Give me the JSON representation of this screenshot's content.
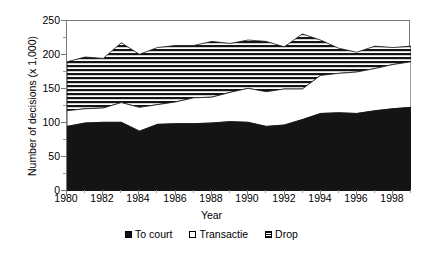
{
  "chart_data": {
    "type": "area",
    "stacked": true,
    "title": "",
    "xlabel": "Year",
    "ylabel": "Number of decisions (x 1,000)",
    "xlim": [
      1980,
      1999
    ],
    "ylim": [
      0,
      250
    ],
    "ytick_values": [
      0,
      50,
      100,
      150,
      200,
      250
    ],
    "ytick_labels": [
      "0",
      "50",
      "100",
      "150",
      "200",
      "250"
    ],
    "xtick_values": [
      1980,
      1982,
      1984,
      1986,
      1988,
      1990,
      1992,
      1994,
      1996,
      1998
    ],
    "xtick_labels": [
      "1980",
      "1982",
      "1984",
      "1986",
      "1988",
      "1990",
      "1992",
      "1994",
      "1996",
      "1998"
    ],
    "x": [
      1980,
      1981,
      1982,
      1983,
      1984,
      1985,
      1986,
      1987,
      1988,
      1989,
      1990,
      1991,
      1992,
      1993,
      1994,
      1995,
      1996,
      1997,
      1998,
      1999
    ],
    "grid": false,
    "legend_position": "bottom",
    "series": [
      {
        "name": "To court",
        "fill": "solid-black",
        "color": "#111111",
        "values": [
          95,
          100,
          101,
          101,
          88,
          98,
          99,
          99,
          100,
          102,
          101,
          95,
          97,
          105,
          114,
          115,
          114,
          118,
          121,
          123
        ]
      },
      {
        "name": "Transactie",
        "fill": "white",
        "color": "#ffffff",
        "values": [
          23,
          21,
          21,
          29,
          35,
          29,
          32,
          38,
          38,
          43,
          50,
          51,
          53,
          45,
          56,
          58,
          61,
          62,
          65,
          67
        ]
      },
      {
        "name": "Drop",
        "fill": "horizontal-stripes",
        "color": "#111111",
        "values": [
          72,
          76,
          73,
          88,
          78,
          84,
          83,
          77,
          82,
          72,
          71,
          74,
          62,
          81,
          52,
          37,
          29,
          33,
          25,
          23
        ]
      }
    ],
    "cumulative_tops": {
      "to_court": [
        95,
        100,
        101,
        101,
        88,
        98,
        99,
        99,
        100,
        102,
        101,
        95,
        97,
        105,
        114,
        115,
        114,
        118,
        121,
        123
      ],
      "transactie": [
        118,
        121,
        122,
        130,
        123,
        127,
        131,
        137,
        138,
        145,
        151,
        146,
        150,
        150,
        170,
        173,
        175,
        180,
        186,
        190
      ],
      "total": [
        190,
        197,
        195,
        218,
        201,
        211,
        214,
        214,
        220,
        217,
        222,
        220,
        212,
        231,
        222,
        210,
        204,
        213,
        211,
        213
      ]
    }
  },
  "axes": {
    "ytitle": "Number of decisions (x 1,000)",
    "xtitle": "Year"
  },
  "legend": {
    "items": [
      {
        "label": "To court",
        "swatch": "solid-black-swatch-icon"
      },
      {
        "label": "Transactie",
        "swatch": "empty-white-swatch-icon"
      },
      {
        "label": "Drop",
        "swatch": "striped-swatch-icon"
      }
    ]
  }
}
